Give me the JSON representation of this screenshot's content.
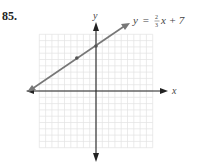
{
  "problem": {
    "number": "85."
  },
  "chart_data": {
    "type": "line",
    "title": "",
    "equation_label": {
      "y": "y",
      "eq": "=",
      "frac_num": "2",
      "frac_den": "3",
      "rest": "x + 7"
    },
    "xlabel": "x",
    "ylabel": "y",
    "grid": true,
    "xlim": [
      -9,
      9
    ],
    "ylim": [
      -9,
      9
    ],
    "slope": 0.6667,
    "intercept": 7,
    "series": [
      {
        "name": "y = (2/3)x + 7",
        "x": [
          -10.5,
          -3,
          0,
          5
        ],
        "y": [
          0,
          5,
          7,
          10.33
        ],
        "marked_points": [
          [
            -3,
            5
          ],
          [
            0,
            7
          ]
        ]
      }
    ],
    "colors": {
      "line": "#777777",
      "axes": "#222222",
      "grid": "#dddddd"
    }
  }
}
